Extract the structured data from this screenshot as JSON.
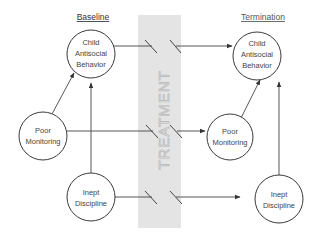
{
  "headers": {
    "left": "Baseline",
    "right": "Termination"
  },
  "treatment": {
    "label": "TREATMENT"
  },
  "nodes": {
    "baseline_child": {
      "lines": [
        "Child",
        "Antisocial",
        "Behavior"
      ]
    },
    "baseline_monitoring": {
      "lines": [
        "Poor",
        "Monitoring"
      ]
    },
    "baseline_discipline": {
      "lines": [
        "Inept",
        "Discipline"
      ]
    },
    "termination_child": {
      "lines": [
        "Child",
        "Antisocial",
        "Behavior"
      ]
    },
    "termination_monitoring": {
      "lines": [
        "Poor",
        "Monitoring"
      ]
    },
    "termination_discipline": {
      "lines": [
        "Inept",
        "Discipline"
      ]
    }
  },
  "edges": [
    {
      "from": "Poor Monitoring (Baseline)",
      "to": "Child Antisocial Behavior (Baseline)"
    },
    {
      "from": "Inept Discipline (Baseline)",
      "to": "Child Antisocial Behavior (Baseline)"
    },
    {
      "from": "Child Antisocial Behavior (Baseline)",
      "to": "Child Antisocial Behavior (Termination)",
      "through_treatment": true
    },
    {
      "from": "Poor Monitoring (Baseline)",
      "to": "Poor Monitoring (Termination)",
      "through_treatment": true
    },
    {
      "from": "Inept Discipline (Baseline)",
      "to": "Inept Discipline (Termination)",
      "through_treatment": true
    },
    {
      "from": "Poor Monitoring (Termination)",
      "to": "Child Antisocial Behavior (Termination)"
    },
    {
      "from": "Inept Discipline (Termination)",
      "to": "Child Antisocial Behavior (Termination)"
    }
  ]
}
